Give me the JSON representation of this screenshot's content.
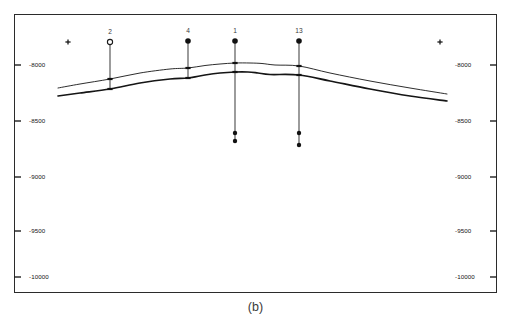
{
  "figure": {
    "caption": "(b)",
    "frame": {
      "x": 14,
      "y": 14,
      "width": 483,
      "height": 279
    }
  },
  "axis": {
    "left_ticks": [
      {
        "label": "-8000",
        "value": -8000,
        "y": 65
      },
      {
        "label": "-8500",
        "value": -8500,
        "y": 121
      },
      {
        "label": "-9000",
        "value": -9000,
        "y": 177
      },
      {
        "label": "-9500",
        "value": -9500,
        "y": 231
      },
      {
        "label": "-10000",
        "value": -10000,
        "y": 277
      }
    ],
    "right_ticks": [
      {
        "label": "-8000",
        "value": -8000,
        "y": 65
      },
      {
        "label": "-8500",
        "value": -8500,
        "y": 121
      },
      {
        "label": "-9000",
        "value": -9000,
        "y": 177
      },
      {
        "label": "-9500",
        "value": -9500,
        "y": 231
      },
      {
        "label": "-10000",
        "value": -10000,
        "y": 277
      }
    ]
  },
  "markers": {
    "cross_left": {
      "name": "plus-marker-left",
      "x": 68,
      "y": 42
    },
    "cross_right": {
      "name": "plus-marker-right",
      "x": 440,
      "y": 42
    }
  },
  "wells": [
    {
      "label": "2",
      "x": 110,
      "head_y": 42,
      "head_style": "open-circle",
      "bottom_y": 90,
      "label_y": 28,
      "picks": [
        {
          "y": 79
        },
        {
          "y": 89
        }
      ],
      "bottom_dots": []
    },
    {
      "label": "4",
      "x": 188,
      "head_y": 41,
      "head_style": "filled-circle",
      "bottom_y": 79,
      "label_y": 27,
      "picks": [
        {
          "y": 68
        },
        {
          "y": 78
        }
      ],
      "bottom_dots": []
    },
    {
      "label": "1",
      "x": 235,
      "head_y": 41,
      "head_style": "filled-circle",
      "bottom_y": 141,
      "label_y": 27,
      "picks": [
        {
          "y": 63
        },
        {
          "y": 72
        }
      ],
      "bottom_dots": [
        {
          "y": 133
        },
        {
          "y": 141
        }
      ]
    },
    {
      "label": "13",
      "x": 299,
      "head_y": 41,
      "head_style": "filled-circle",
      "bottom_y": 145,
      "label_y": 27,
      "picks": [
        {
          "y": 66
        },
        {
          "y": 75
        }
      ],
      "bottom_dots": [
        {
          "y": 133
        },
        {
          "y": 145
        }
      ]
    }
  ],
  "chart_data": {
    "type": "line",
    "title": "",
    "xlabel": "",
    "ylabel": "",
    "ylim": [
      -10000,
      -7800
    ],
    "grid": false,
    "legend": "none",
    "annotations": [
      "(b)",
      "+",
      "+"
    ],
    "axis_tick_labels": [
      "-8000",
      "-8500",
      "-9000",
      "-9500",
      "-10000"
    ],
    "well_labels": [
      "2",
      "4",
      "1",
      "13"
    ],
    "series": [
      {
        "name": "upper-horizon",
        "stroke_width": 0.9,
        "points": [
          [
            58,
            88
          ],
          [
            80,
            84
          ],
          [
            110,
            79
          ],
          [
            140,
            73
          ],
          [
            170,
            69
          ],
          [
            188,
            68
          ],
          [
            205,
            65.5
          ],
          [
            220,
            64
          ],
          [
            235,
            63
          ],
          [
            250,
            63
          ],
          [
            262,
            63.5
          ],
          [
            275,
            65
          ],
          [
            299,
            66
          ],
          [
            330,
            73
          ],
          [
            370,
            81
          ],
          [
            410,
            88
          ],
          [
            447,
            94
          ]
        ]
      },
      {
        "name": "lower-horizon",
        "stroke_width": 1.7,
        "points": [
          [
            58,
            96
          ],
          [
            80,
            93
          ],
          [
            110,
            89
          ],
          [
            140,
            83
          ],
          [
            170,
            79
          ],
          [
            188,
            78
          ],
          [
            205,
            75
          ],
          [
            220,
            73
          ],
          [
            235,
            72
          ],
          [
            248,
            72
          ],
          [
            258,
            73
          ],
          [
            270,
            74.5
          ],
          [
            299,
            75
          ],
          [
            330,
            81
          ],
          [
            370,
            89
          ],
          [
            410,
            96
          ],
          [
            447,
            101
          ]
        ]
      }
    ]
  }
}
